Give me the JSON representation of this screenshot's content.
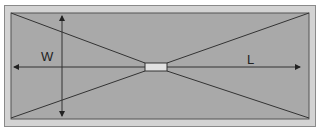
{
  "diagram": {
    "labels": {
      "width": "W",
      "length": "L"
    },
    "colors": {
      "outer_frame": "#d3d3d3",
      "inner_area": "#a9a9a9",
      "center_element": "#e2e2e2",
      "lines": "#333333"
    }
  }
}
